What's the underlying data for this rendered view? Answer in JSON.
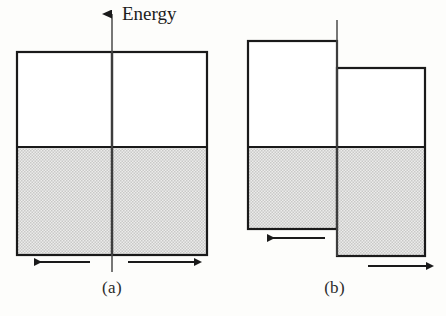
{
  "figure": {
    "background_color": "#fdfdfb",
    "line_color": "#1a1a1a",
    "fill_color": "#d9d9d9",
    "axis_label": "Energy",
    "panels": [
      {
        "id": "a",
        "caption": "(a)",
        "description": "Two identical metal blocks in contact with aligned Fermi levels, equal and opposite electron flow",
        "blocks": [
          {
            "side": "left",
            "x": 17,
            "y": 52,
            "width": 95,
            "height": 203,
            "filled_from_y": 147,
            "top_energy": 52,
            "fermi_level": 147,
            "bottom_energy": 255
          },
          {
            "side": "right",
            "x": 112,
            "y": 52,
            "width": 95,
            "height": 203,
            "filled_from_y": 147,
            "top_energy": 52,
            "fermi_level": 147,
            "bottom_energy": 255
          }
        ],
        "arrows": [
          {
            "name": "electron-flow-left",
            "direction": "left",
            "x1": 90,
            "x2": 32,
            "y": 262
          },
          {
            "name": "electron-flow-right",
            "direction": "right",
            "x1": 128,
            "x2": 196,
            "y": 262
          }
        ],
        "axis": {
          "x": 112,
          "y_top": 10,
          "y_bottom": 272,
          "arrowhead": "up"
        }
      },
      {
        "id": "b",
        "caption": "(b)",
        "description": "Two metal blocks with offset Fermi levels after contact potential develops, net electron flow",
        "blocks": [
          {
            "side": "left",
            "x": 248,
            "y": 41,
            "width": 89,
            "height": 188,
            "filled_from_y": 147,
            "top_energy": 41,
            "fermi_level": 147,
            "bottom_energy": 229
          },
          {
            "side": "right",
            "x": 337,
            "y": 68,
            "width": 88,
            "height": 188,
            "filled_from_y": 147,
            "top_energy": 68,
            "fermi_level": 147,
            "bottom_energy": 256
          }
        ],
        "arrows": [
          {
            "name": "electron-flow-left",
            "direction": "left",
            "x1": 188,
            "x2": 128,
            "y": 238
          },
          {
            "name": "electron-flow-right",
            "direction": "right",
            "x1": 368,
            "x2": 428,
            "y": 266
          }
        ],
        "divider": {
          "x": 337,
          "y_top": 20,
          "y_bottom": 256
        }
      }
    ]
  }
}
